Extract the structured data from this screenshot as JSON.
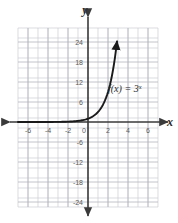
{
  "chart_data": {
    "type": "line",
    "title": "",
    "subtitle": "",
    "xlabel": "x",
    "ylabel": "y",
    "function_label": "f(x) = 3",
    "function_exponent": "x",
    "function_expression": "f(x) = 3^x",
    "grid": true,
    "grid_step_x": 1,
    "grid_step_y": 3,
    "xlim": [
      -7,
      7
    ],
    "ylim": [
      -27,
      27
    ],
    "x_ticks": [
      -6,
      -4,
      -2,
      0,
      2,
      4,
      6
    ],
    "x_tick_labels": [
      "-6",
      "-4",
      "-2",
      "0",
      "2",
      "4",
      "6"
    ],
    "y_ticks": [
      24,
      18,
      12,
      6,
      -6,
      -12,
      -18,
      -24
    ],
    "y_tick_labels": [
      "24",
      "18",
      "12",
      "6",
      "-6",
      "-12",
      "-18",
      "-24"
    ],
    "series": [
      {
        "name": "f(x) = 3^x",
        "color": "#1a1a1a",
        "arrow_end": true,
        "x": [
          -7,
          -6,
          -5,
          -4,
          -3,
          -2.5,
          -2,
          -1.5,
          -1,
          -0.5,
          0,
          0.5,
          1,
          1.5,
          2,
          2.5,
          3
        ],
        "y": [
          0.0005,
          0.0014,
          0.0041,
          0.0123,
          0.037,
          0.064,
          0.111,
          0.192,
          0.333,
          0.577,
          1,
          1.732,
          3,
          5.196,
          9,
          15.588,
          27
        ]
      }
    ],
    "annotations": [
      {
        "text": "f(x) = 3^x",
        "x": 2.0,
        "y": 13.5
      }
    ],
    "colors": {
      "curve": "#1a1a1a",
      "axis": "#3a3a3a",
      "grid": "#c9c9cf",
      "grid_major": "#b0b0b8",
      "tick_text": "#5a5a5a",
      "background": "#ffffff"
    }
  },
  "axes": {
    "y_axis_name": "y",
    "x_axis_name": "x"
  },
  "ticks": {
    "x": [
      "-6",
      "-4",
      "-2",
      "0",
      "2",
      "4",
      "6"
    ],
    "y_positive": [
      "24",
      "18",
      "12",
      "6"
    ],
    "y_negative": [
      "-6",
      "-12",
      "-18",
      "-24"
    ]
  }
}
